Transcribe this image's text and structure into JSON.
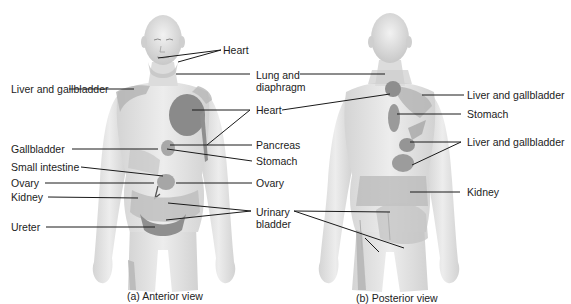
{
  "figure": {
    "panels": [
      {
        "id": "anterior",
        "caption": "(a) Anterior view",
        "labels": {
          "heart_face": "Heart",
          "lung_diaphragm_1": "Lung and",
          "lung_diaphragm_2": "diaphragm",
          "liver_gallbladder": "Liver and gallbladder",
          "heart_chest": "Heart",
          "gallbladder": "Gallbladder",
          "pancreas": "Pancreas",
          "stomach": "Stomach",
          "small_intestine": "Small intestine",
          "ovary_left": "Ovary",
          "ovary_right": "Ovary",
          "kidney": "Kidney",
          "urinary_bladder_1": "Urinary",
          "urinary_bladder_2": "bladder",
          "ureter": "Ureter"
        }
      },
      {
        "id": "posterior",
        "caption": "(b) Posterior view",
        "labels": {
          "liver_gallbladder_upper": "Liver and gallbladder",
          "stomach": "Stomach",
          "liver_gallbladder_lower": "Liver and gallbladder",
          "kidney": "Kidney"
        }
      }
    ],
    "colors": {
      "skin_light": "#e6e6e6",
      "skin_mid": "#cfcfcf",
      "referred_area": "#a9a9a9",
      "referred_dark": "#7e7e7e",
      "leader_line": "#1a1a1a"
    }
  }
}
